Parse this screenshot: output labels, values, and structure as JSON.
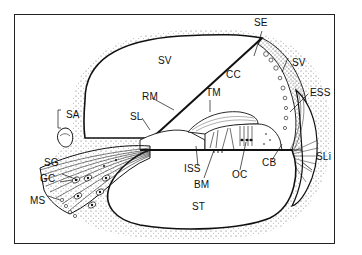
{
  "figure": {
    "labels": {
      "SV_top": "SV",
      "CC": "CC",
      "SE": "SE",
      "SV_right": "SV",
      "ESS": "ESS",
      "RM": "RM",
      "TM": "TM",
      "SL": "SL",
      "SA": "SA",
      "SG": "SG",
      "GC": "GC",
      "MS": "MS",
      "ISS": "ISS",
      "BM": "BM",
      "OC": "OC",
      "CB": "CB",
      "SLi": "SLi",
      "ST": "ST"
    }
  },
  "colors": {
    "ink": "#111111",
    "stipple": "#555555",
    "background": "#ffffff"
  }
}
